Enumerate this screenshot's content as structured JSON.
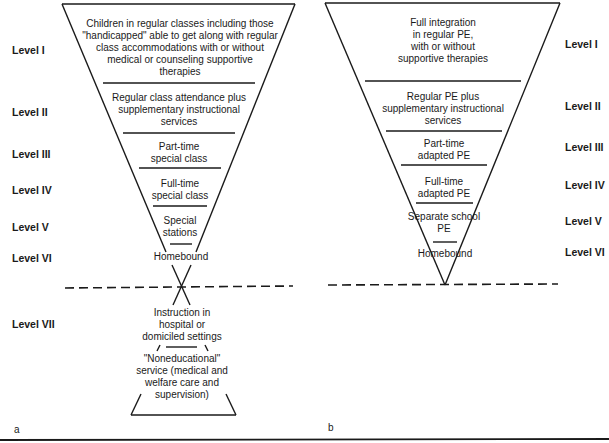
{
  "panel_a": {
    "label": "a",
    "levels": [
      {
        "name": "Level I",
        "text": "Children in regular classes including those\n\"handicapped\" able to get along with regular\nclass accommodations with or without\nmedical or counseling supportive\ntherapies"
      },
      {
        "name": "Level II",
        "text": "Regular class attendance plus\nsupplementary instructional\nservices"
      },
      {
        "name": "Level III",
        "text": "Part-time\nspecial class"
      },
      {
        "name": "Level IV",
        "text": "Full-time\nspecial class"
      },
      {
        "name": "Level V",
        "text": "Special\nstations"
      },
      {
        "name": "Level VI",
        "text": "Homebound"
      },
      {
        "name": "Level VII",
        "text": "Instruction in\nhospital or\ndomiciled settings"
      }
    ],
    "bottom_text": "\"Noneducational\"\nservice (medical and\nwelfare care and\nsupervision)"
  },
  "panel_b": {
    "label": "b",
    "levels": [
      {
        "name": "Level I",
        "text": "Full integration\nin regular PE,\nwith or without\nsupportive therapies"
      },
      {
        "name": "Level II",
        "text": "Regular PE plus\nsupplementary instructional\nservices"
      },
      {
        "name": "Level III",
        "text": "Part-time\nadapted PE"
      },
      {
        "name": "Level IV",
        "text": "Full-time\nadapted PE"
      },
      {
        "name": "Level V",
        "text": "Separate school\nPE"
      },
      {
        "name": "Level VI",
        "text": "Homebound"
      }
    ]
  },
  "colors": {
    "ink": "#1a1a1a",
    "background": "#ffffff"
  }
}
